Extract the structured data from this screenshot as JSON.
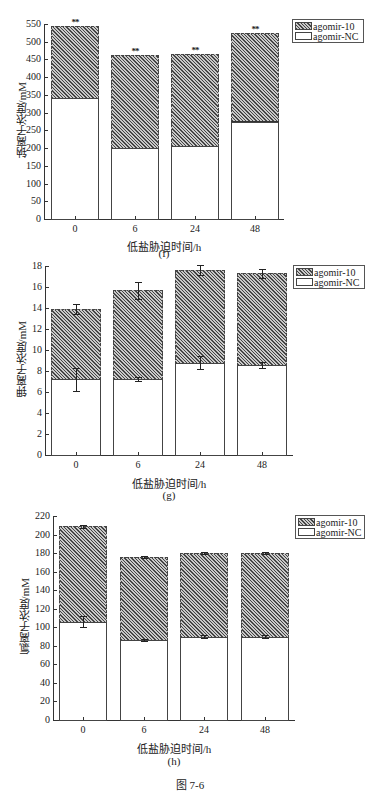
{
  "chart_data": [
    {
      "id": "f",
      "type": "bar",
      "stacked": true,
      "title": "",
      "subtitle": "(f)",
      "xlabel": "低盐胁迫时间/h",
      "ylabel": "钠离子浓度/mM",
      "categories": [
        "0",
        "6",
        "24",
        "48"
      ],
      "ylim": [
        0,
        550
      ],
      "yticks": [
        0,
        50,
        100,
        150,
        200,
        250,
        300,
        350,
        400,
        450,
        500,
        550
      ],
      "grid": false,
      "legend_position": "upper right",
      "series": [
        {
          "name": "agomir-NC",
          "values": [
            340,
            200,
            207,
            275
          ]
        },
        {
          "name": "agomir-10",
          "values_total": [
            545,
            462,
            465,
            525
          ]
        }
      ],
      "annotations": [
        "**",
        "**",
        "**",
        "**"
      ]
    },
    {
      "id": "g",
      "type": "bar",
      "stacked": true,
      "title": "",
      "subtitle": "(g)",
      "xlabel": "低盐胁迫时间/h",
      "ylabel": "钾离子浓度/mM",
      "categories": [
        "0",
        "6",
        "24",
        "48"
      ],
      "ylim": [
        0,
        18
      ],
      "yticks": [
        0,
        2,
        4,
        6,
        8,
        10,
        12,
        14,
        16,
        18
      ],
      "grid": false,
      "legend_position": "upper right",
      "series": [
        {
          "name": "agomir-NC",
          "values": [
            7.2,
            7.2,
            8.8,
            8.6
          ],
          "errors": [
            1.1,
            0.2,
            0.6,
            0.3
          ]
        },
        {
          "name": "agomir-10",
          "values_total": [
            13.9,
            15.7,
            17.6,
            17.3
          ],
          "errors": [
            0.5,
            0.8,
            0.5,
            0.4
          ]
        }
      ]
    },
    {
      "id": "h",
      "type": "bar",
      "stacked": true,
      "title": "",
      "subtitle": "(h)",
      "xlabel": "低盐胁迫时间/h",
      "ylabel": "氯离子浓度/mM",
      "categories": [
        "0",
        "6",
        "24",
        "48"
      ],
      "ylim": [
        0,
        220
      ],
      "yticks": [
        0,
        20,
        40,
        60,
        80,
        100,
        120,
        140,
        160,
        180,
        200,
        220
      ],
      "grid": false,
      "legend_position": "upper right",
      "series": [
        {
          "name": "agomir-NC",
          "values": [
            106,
            86,
            90,
            90
          ],
          "errors": [
            6,
            1,
            2,
            2
          ]
        },
        {
          "name": "agomir-10",
          "values_total": [
            209,
            176,
            180,
            180
          ],
          "errors": [
            1.5,
            1,
            1.5,
            1.5
          ]
        }
      ]
    }
  ],
  "legend": {
    "ag": "agomir-10",
    "nc": "agomir-NC"
  },
  "figure_caption": "图 7-6",
  "colors": {
    "hatch_dark": "#444444",
    "hatch_light": "#c8c8c8",
    "nc_fill": "#ffffff",
    "axis": "#333333"
  }
}
